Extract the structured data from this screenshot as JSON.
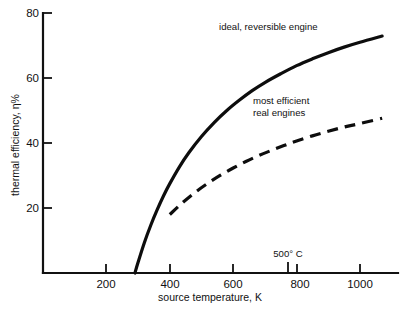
{
  "chart_data": {
    "type": "line",
    "title": "",
    "subtitle": "",
    "xlabel": "source temperature, K",
    "ylabel": "thermal efficiency, η%",
    "xlim": [
      0,
      1120
    ],
    "ylim": [
      0,
      80
    ],
    "xticks": [
      200,
      400,
      600,
      800,
      1000
    ],
    "xtick_labels": [
      "200",
      "400",
      "600",
      "800",
      "1000"
    ],
    "yticks": [
      20,
      40,
      60,
      80
    ],
    "ytick_labels": [
      "20",
      "40",
      "60",
      "80"
    ],
    "grid": false,
    "legend_position": "inline-annotations",
    "annotations": [
      {
        "name": "ideal-curve-label",
        "text": "ideal, reversible engine",
        "x": 760,
        "y": 76
      },
      {
        "name": "real-curve-label-line1",
        "text": "most efficient",
        "x": 800,
        "y": 55
      },
      {
        "name": "real-curve-label-line2",
        "text": "real engines",
        "x": 800,
        "y": 51
      },
      {
        "name": "temperature-marker-label",
        "text": "500° C",
        "x": 773,
        "y": 7
      }
    ],
    "markers": [
      {
        "name": "500C-tick",
        "x": 773,
        "label": "500° C",
        "note": "extra axis tick at 773 K equivalent to 500 degrees Celsius"
      }
    ],
    "series": [
      {
        "name": "ideal, reversible engine",
        "style": "solid",
        "color": "#0d0d0d",
        "x": [
          290,
          300,
          320,
          340,
          360,
          380,
          400,
          430,
          460,
          500,
          540,
          580,
          620,
          660,
          700,
          750,
          800,
          850,
          900,
          950,
          1000,
          1070
        ],
        "values": [
          0,
          3.3,
          9.4,
          14.7,
          19.4,
          23.7,
          27.5,
          32.6,
          37.0,
          42.0,
          46.3,
          50.0,
          53.2,
          56.1,
          58.6,
          61.3,
          63.8,
          65.9,
          67.8,
          69.5,
          71.0,
          72.9
        ]
      },
      {
        "name": "most efficient real engines",
        "style": "dashed",
        "color": "#0d0d0d",
        "x": [
          400,
          440,
          480,
          520,
          560,
          600,
          640,
          680,
          720,
          760,
          800,
          850,
          900,
          950,
          1000,
          1070
        ],
        "values": [
          18.0,
          21.6,
          24.8,
          27.6,
          30.1,
          32.3,
          34.3,
          36.1,
          37.7,
          39.2,
          40.6,
          42.2,
          43.6,
          44.9,
          46.0,
          47.6
        ]
      }
    ]
  },
  "figure": {
    "background_color": "#ffffff",
    "axis_color": "#111111"
  }
}
